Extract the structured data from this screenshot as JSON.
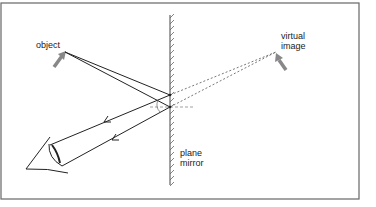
{
  "labels": {
    "object": "object",
    "virtual_image": "virtual\nimage",
    "mirror": "plane\nmirror"
  },
  "elements": {
    "object_arrow": "object-arrow",
    "image_arrow": "virtual-image-arrow",
    "eye": "eye",
    "mirror": "plane-mirror"
  },
  "colors": {
    "frame": "#666666",
    "ray": "#222222",
    "dashed": "#555555",
    "arrow_fill": "#888888",
    "text": "#222222"
  }
}
